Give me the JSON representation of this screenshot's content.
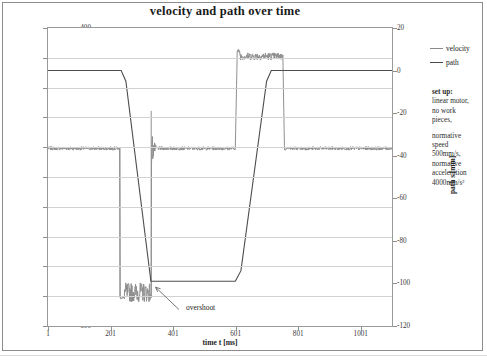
{
  "chart_data": {
    "type": "line",
    "title": "velocity and path over time",
    "xlabel": "time t [ms]",
    "ylabel": "velocity v [mm/s]",
    "y2label": "path s [mm]",
    "xlim": [
      1,
      1101
    ],
    "ylim": [
      -600,
      400
    ],
    "y2lim": [
      -120,
      20
    ],
    "grid": true,
    "legend_position": "right",
    "xticks": [
      "1",
      "201",
      "401",
      "601",
      "801",
      "1001"
    ],
    "xtick_values": [
      1,
      201,
      401,
      601,
      801,
      1001
    ],
    "yticks": [
      "400",
      "300",
      "200",
      "100",
      "0",
      "-100",
      "-200",
      "-300",
      "-400",
      "-500",
      "-600"
    ],
    "ytick_values": [
      400,
      300,
      200,
      100,
      0,
      -100,
      -200,
      -300,
      -400,
      -500,
      -600
    ],
    "y2ticks": [
      "20",
      "0",
      "-20",
      "-40",
      "-60",
      "-80",
      "-100",
      "-120"
    ],
    "y2tick_values": [
      20,
      0,
      -20,
      -40,
      -60,
      -80,
      -100,
      -120
    ],
    "series": [
      {
        "name": "velocity",
        "axis": "left",
        "unit": "mm/s",
        "color": "#8f8f8f",
        "description": "noisy signal around 0 with a negative plateau near -500 and a positive plateau near +300",
        "keypoints": [
          {
            "t": 1,
            "v": 0
          },
          {
            "t": 230,
            "v": 0
          },
          {
            "t": 232,
            "v": -505
          },
          {
            "t": 330,
            "v": -505
          },
          {
            "t": 332,
            "v": 120
          },
          {
            "t": 340,
            "v": 0
          },
          {
            "t": 600,
            "v": 0
          },
          {
            "t": 604,
            "v": 310
          },
          {
            "t": 755,
            "v": 310
          },
          {
            "t": 758,
            "v": 0
          },
          {
            "t": 1101,
            "v": 0
          }
        ],
        "negative_plateau": -505,
        "positive_plateau": 310,
        "noise_amplitude": 25
      },
      {
        "name": "path",
        "axis": "right",
        "unit": "mm",
        "color": "#4d4d4d",
        "description": "ramps from 0 mm down to about -99 mm, dwells, then ramps back to 0 mm",
        "keypoints": [
          {
            "t": 1,
            "s": 0
          },
          {
            "t": 235,
            "s": 0
          },
          {
            "t": 250,
            "s": -5
          },
          {
            "t": 330,
            "s": -99
          },
          {
            "t": 600,
            "s": -99
          },
          {
            "t": 618,
            "s": -94
          },
          {
            "t": 700,
            "s": -5
          },
          {
            "t": 715,
            "s": 0
          },
          {
            "t": 1101,
            "s": 0
          }
        ],
        "start_value": 0,
        "dwell_value": -99,
        "end_value": 0
      }
    ],
    "annotations": [
      {
        "label": "overshoot",
        "target_t": 345,
        "target_v": -470,
        "text_t": 420,
        "text_v": -545
      }
    ]
  },
  "legend": {
    "items": [
      {
        "label": "velocity",
        "color": "#8f8f8f"
      },
      {
        "label": "path",
        "color": "#4d4d4d"
      }
    ]
  },
  "setup_note": {
    "heading": "set up:",
    "line1": "linear motor,",
    "line2": "no work",
    "line3": "pieces,",
    "line4": "normative",
    "line5": "speed",
    "line6": "500mm/s,",
    "line7": "normative",
    "line8": "acceleration",
    "line9": "4000mm/s²"
  }
}
